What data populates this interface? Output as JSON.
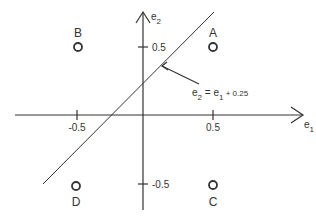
{
  "diagram": {
    "axes": {
      "x_label": "e",
      "x_sub": "1",
      "y_label": "e",
      "y_sub": "2",
      "x_ticks": [
        "-0.5",
        "0.5"
      ],
      "y_ticks": [
        "0.5",
        "-0.5"
      ]
    },
    "points": [
      {
        "label": "A",
        "x": 0.5,
        "y": 0.5
      },
      {
        "label": "B",
        "x": -0.5,
        "y": 0.5
      },
      {
        "label": "C",
        "x": 0.5,
        "y": -0.5
      },
      {
        "label": "D",
        "x": -0.5,
        "y": -0.5
      }
    ],
    "line": {
      "equation_lhs": "e",
      "equation_lhs_sub": "2",
      "equation_eq": " = e",
      "equation_rhs_sub": "1",
      "equation_const": " + 0.25"
    },
    "colors": {
      "stroke": "#333333",
      "background": "#ffffff"
    }
  }
}
